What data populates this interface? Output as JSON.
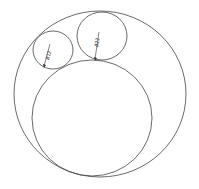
{
  "diagram": {
    "type": "cad-circles",
    "stroke_color": "#444444",
    "background": "#ffffff",
    "circles": [
      {
        "name": "outer",
        "cx": 100,
        "cy": 94,
        "rx": 86,
        "ry": 83
      },
      {
        "name": "large-inner",
        "cx": 92,
        "cy": 118,
        "rx": 60,
        "ry": 58
      },
      {
        "name": "small-left",
        "cx": 53,
        "cy": 50,
        "rx": 20,
        "ry": 19
      },
      {
        "name": "small-top",
        "cx": 102,
        "cy": 36,
        "rx": 25,
        "ry": 24
      }
    ],
    "dimensions": [
      {
        "label": "Ø12",
        "x": 48,
        "y": 55
      },
      {
        "label": "Ø22",
        "x": 97,
        "y": 45
      }
    ]
  }
}
